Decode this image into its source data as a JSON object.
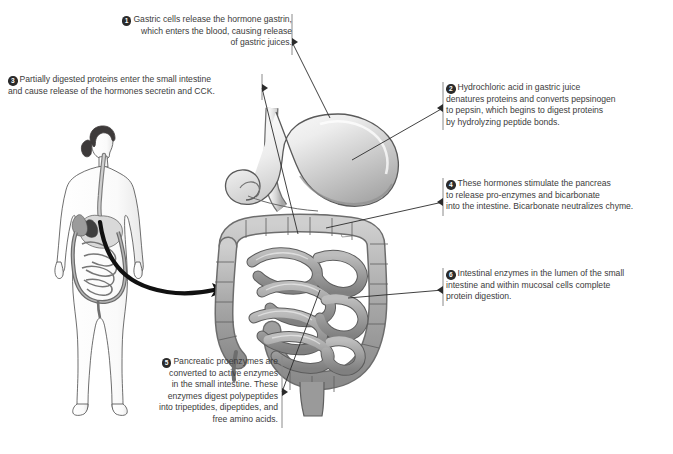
{
  "diagram": {
    "text_color": "#3b3b3b",
    "badge_color": "#2b2b2b",
    "background": "#ffffff"
  },
  "callouts": [
    {
      "number": "1",
      "name": "callout-gastrin",
      "text": "Gastric cells release the hormone gastrin,\nwhich enters the blood, causing release\nof gastric juices."
    },
    {
      "number": "2",
      "name": "callout-hydrochloric-acid",
      "text": "Hydrochloric acid in gastric juice\ndenatures proteins and converts pepsinogen\nto pepsin, which begins to digest proteins\nby hydrolyzing peptide bonds."
    },
    {
      "number": "3",
      "name": "callout-secretin-cck",
      "text": "Partially digested proteins enter the small intestine\nand cause release of the hormones secretin and CCK."
    },
    {
      "number": "4",
      "name": "callout-pancreas-bicarbonate",
      "text": "These hormones stimulate the pancreas\nto release pro-enzymes and bicarbonate\ninto the intestine.  Bicarbonate neutralizes chyme."
    },
    {
      "number": "5",
      "name": "callout-pancreatic-proenzymes",
      "text": "Pancreatic proenzymes are\nconverted to active enzymes\nin the small intestine.  These\nenzymes digest polypeptides\ninto tripeptides, dipeptides, and\nfree amino acids."
    },
    {
      "number": "6",
      "name": "callout-intestinal-enzymes",
      "text": "Intestinal enzymes in the lumen of the small\nintestine and within mucosal cells complete\nprotein digestion."
    }
  ],
  "illustration": {
    "human_figure": "human-body-silhouette-with-digestive-tract",
    "pointer_arrow": "curved-arrow-body-to-organs",
    "organs": [
      "esophagus",
      "stomach",
      "duodenum",
      "pancreas",
      "small-intestine",
      "large-intestine",
      "rectum"
    ]
  }
}
